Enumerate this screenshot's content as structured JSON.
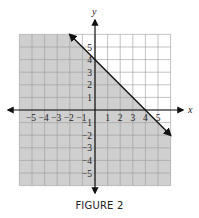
{
  "chart_data": {
    "type": "line",
    "title": "",
    "caption": "FIGURE 2",
    "xlabel": "x",
    "ylabel": "y",
    "xlim": [
      -6,
      6
    ],
    "ylim": [
      -6,
      6
    ],
    "grid": true,
    "xticks": [
      -5,
      -4,
      -3,
      -2,
      -1,
      1,
      2,
      3,
      4,
      5
    ],
    "yticks": [
      -5,
      -4,
      -3,
      -2,
      -1,
      1,
      2,
      3,
      4,
      5
    ],
    "xtick_labels": [
      "−5",
      "−4",
      "−3",
      "−2",
      "−1",
      "1",
      "2",
      "3",
      "4",
      "5"
    ],
    "ytick_labels": [
      "−5",
      "−4",
      "−3",
      "−2",
      "−1",
      "1",
      "2",
      "3",
      "4",
      "5"
    ],
    "series": [
      {
        "name": "boundary line y = -x + 4",
        "style": "solid",
        "arrows": "both",
        "x": [
          -2,
          6
        ],
        "y": [
          6,
          -2
        ]
      }
    ],
    "shaded_region": {
      "description": "half-plane below and including the line",
      "inequality": "x + y ≤ 4",
      "color": "#c8c8c8"
    },
    "intercepts": {
      "x_intercept": [
        4,
        0
      ],
      "y_intercept": [
        0,
        4
      ]
    }
  },
  "colors": {
    "shade": "#cfcfcf",
    "grid": "#9a9a9a",
    "axis": "#111111",
    "line": "#111111"
  }
}
